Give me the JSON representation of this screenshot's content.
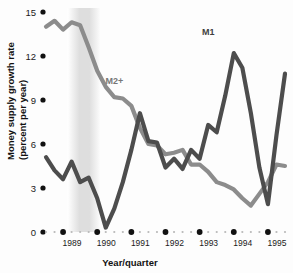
{
  "chart_data": {
    "type": "line",
    "title": "",
    "xlabel": "Year/quarter",
    "ylabel": "Money supply growth rate (percent per year)",
    "ylabel_line1": "Money supply growth rate",
    "ylabel_line2": "(percent per year)",
    "ylim": [
      0,
      15
    ],
    "yticks": [
      0,
      3,
      6,
      9,
      12,
      15
    ],
    "ytick_labels": [
      "0",
      "3",
      "6",
      "9",
      "12",
      "15"
    ],
    "xlim": [
      "1988Q3",
      "1995Q4"
    ],
    "xticks": [
      "1989",
      "1990",
      "1991",
      "1992",
      "1993",
      "1994",
      "1995"
    ],
    "xtick_labels": [
      "1989",
      "1990",
      "1991",
      "1992",
      "1993",
      "1994",
      "1995"
    ],
    "grid": false,
    "legend": "inline-annotations",
    "x": [
      "1988Q3",
      "1988Q4",
      "1989Q1",
      "1989Q2",
      "1989Q3",
      "1989Q4",
      "1990Q1",
      "1990Q2",
      "1990Q3",
      "1990Q4",
      "1991Q1",
      "1991Q2",
      "1991Q3",
      "1991Q4",
      "1992Q1",
      "1992Q2",
      "1992Q3",
      "1992Q4",
      "1993Q1",
      "1993Q2",
      "1993Q3",
      "1993Q4",
      "1994Q1",
      "1994Q2",
      "1994Q3",
      "1994Q4",
      "1995Q1",
      "1995Q2",
      "1995Q3"
    ],
    "series": [
      {
        "name": "M1",
        "color": "#4d4d4d",
        "label_x": "1993Q2",
        "label_y": 13.4,
        "values": [
          5.1,
          4.2,
          3.6,
          4.8,
          3.4,
          3.7,
          2.3,
          0.3,
          1.6,
          3.4,
          5.6,
          8.1,
          6.2,
          6.1,
          4.4,
          5.0,
          4.3,
          5.6,
          5.0,
          7.3,
          6.8,
          9.3,
          12.2,
          11.2,
          8.1,
          4.4,
          1.9,
          6.6,
          10.8
        ]
      },
      {
        "name": "M2+",
        "color": "#8c8c8c",
        "label_x": "1990Q3",
        "label_y": 10.1,
        "values": [
          14.0,
          14.4,
          13.8,
          14.3,
          14.1,
          12.6,
          11.0,
          9.9,
          9.2,
          9.1,
          8.6,
          7.1,
          6.0,
          5.9,
          5.3,
          5.4,
          5.6,
          4.6,
          4.6,
          4.1,
          3.4,
          3.2,
          2.9,
          2.3,
          1.8,
          2.6,
          3.4,
          4.6,
          4.5
        ]
      }
    ],
    "shaded_band": {
      "name": "recession-band",
      "from": "1989Q2",
      "to": "1990Q1",
      "color": "#d8d8d8"
    }
  }
}
